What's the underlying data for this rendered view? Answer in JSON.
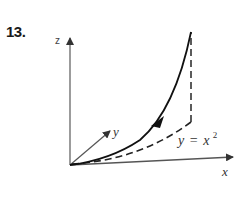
{
  "problem": {
    "number": "13."
  },
  "axes": {
    "z_label": "z",
    "y_label": "y",
    "x_label": "x"
  },
  "curve_label": {
    "lhs": "y",
    "eq": "=",
    "rhs": "x",
    "exponent": "2"
  },
  "colors": {
    "axis": "#555555",
    "curve": "#111111",
    "dashed": "#222222"
  }
}
